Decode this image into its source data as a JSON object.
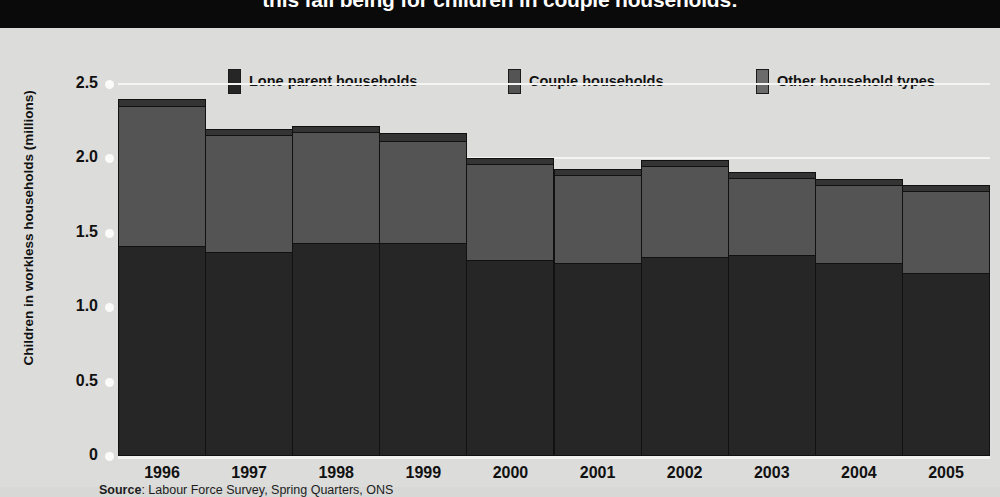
{
  "title": {
    "text": "this fall being for children in couple households:"
  },
  "legend": {
    "items": [
      {
        "label": "Lone parent households",
        "color": "#262626",
        "key": "lone"
      },
      {
        "label": "Couple households",
        "color": "#545454",
        "key": "couple"
      },
      {
        "label": "Other household types",
        "color": "#6b6b6b",
        "key": "other"
      }
    ]
  },
  "source": {
    "prefix": "Source",
    "text": ": Labour Force Survey, Spring Quarters, ONS"
  },
  "chart_data": {
    "type": "bar",
    "stacked": true,
    "title": "this fall being for children in couple households:",
    "xlabel": "",
    "ylabel": "Children in workless households (millions)",
    "ylim": [
      0,
      2.5
    ],
    "yticks": [
      "0",
      "0.5",
      "1.0",
      "1.5",
      "2.0",
      "2.5"
    ],
    "ytick_values": [
      0,
      0.5,
      1.0,
      1.5,
      2.0,
      2.5
    ],
    "grid": true,
    "legend_position": "top",
    "categories": [
      "1996",
      "1997",
      "1998",
      "1999",
      "2000",
      "2001",
      "2002",
      "2003",
      "2004",
      "2005"
    ],
    "series": [
      {
        "name": "Lone parent households",
        "color": "#262626",
        "values": [
          1.41,
          1.37,
          1.43,
          1.43,
          1.32,
          1.3,
          1.34,
          1.35,
          1.3,
          1.23
        ]
      },
      {
        "name": "Couple households",
        "color": "#545454",
        "values": [
          0.94,
          0.79,
          0.75,
          0.69,
          0.64,
          0.59,
          0.61,
          0.52,
          0.52,
          0.55
        ]
      },
      {
        "name": "Other household types",
        "color": "#6b6b6b",
        "values": [
          0.05,
          0.04,
          0.04,
          0.05,
          0.04,
          0.04,
          0.04,
          0.04,
          0.04,
          0.04
        ]
      }
    ],
    "totals": [
      2.4,
      2.2,
      2.22,
      2.17,
      2.0,
      1.93,
      1.99,
      1.91,
      1.86,
      1.82
    ]
  }
}
